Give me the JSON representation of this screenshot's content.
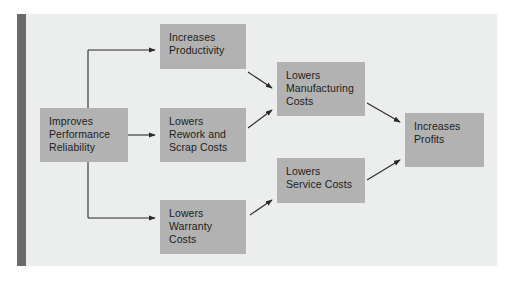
{
  "diagram": {
    "type": "flowchart",
    "frame": {
      "background": "#eceded",
      "spine_color": "#6b6b6b"
    },
    "node_fill": "#b2b2b2",
    "node_text_color": "#1d1d1d",
    "arrow_color": "#2b2b2b",
    "nodes": [
      {
        "id": "improve",
        "label": "Improves\nPerformance\nReliability"
      },
      {
        "id": "productivity",
        "label": "Increases\nProductivity"
      },
      {
        "id": "rework",
        "label": "Lowers\nRework and\nScrap Costs"
      },
      {
        "id": "warranty",
        "label": "Lowers\nWarranty\nCosts"
      },
      {
        "id": "manufacturing",
        "label": "Lowers\nManufacturing\nCosts"
      },
      {
        "id": "service",
        "label": "Lowers\nService Costs"
      },
      {
        "id": "profits",
        "label": "Increases\nProfits"
      }
    ],
    "edges": [
      {
        "from": "improve",
        "to": "productivity"
      },
      {
        "from": "improve",
        "to": "rework"
      },
      {
        "from": "improve",
        "to": "warranty"
      },
      {
        "from": "productivity",
        "to": "manufacturing"
      },
      {
        "from": "rework",
        "to": "manufacturing"
      },
      {
        "from": "warranty",
        "to": "service"
      },
      {
        "from": "manufacturing",
        "to": "profits"
      },
      {
        "from": "service",
        "to": "profits"
      }
    ]
  }
}
